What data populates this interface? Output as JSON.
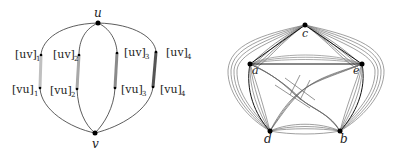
{
  "left_figure": {
    "vertices": {
      "u": "u",
      "v": "v"
    },
    "labels": [
      {
        "base": "[uv]",
        "sub": "1"
      },
      {
        "base": "[uv]",
        "sub": "2"
      },
      {
        "base": "[uv]",
        "sub": "3"
      },
      {
        "base": "[uv]",
        "sub": "4"
      },
      {
        "base": "[vu]",
        "sub": "1"
      },
      {
        "base": "[vu]",
        "sub": "2"
      },
      {
        "base": "[vu]",
        "sub": "3"
      },
      {
        "base": "[vu]",
        "sub": "4"
      }
    ]
  },
  "right_figure": {
    "vertices": {
      "c": "c",
      "a": "a",
      "e": "e",
      "d": "d",
      "b": "b"
    }
  },
  "colors": {
    "edge": "#333333",
    "bundle_light": "#b8b8b8",
    "bundle_dark": "#555555",
    "vertex": "#000000"
  }
}
